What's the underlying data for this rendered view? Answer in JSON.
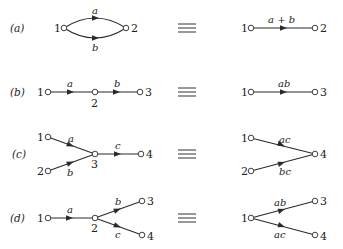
{
  "diagram": {
    "equiv_symbol": "≡",
    "rows": [
      {
        "id": "a",
        "label": "(a)",
        "left": {
          "nodes": [
            {
              "id": "1",
              "label": "1"
            },
            {
              "id": "2",
              "label": "2"
            }
          ],
          "edges": [
            {
              "from": "1",
              "to": "2",
              "label": "a",
              "shape": "upper-arc"
            },
            {
              "from": "1",
              "to": "2",
              "label": "b",
              "shape": "lower-arc"
            }
          ]
        },
        "right": {
          "nodes": [
            {
              "id": "1",
              "label": "1"
            },
            {
              "id": "2",
              "label": "2"
            }
          ],
          "edges": [
            {
              "from": "1",
              "to": "2",
              "label": "a + b"
            }
          ]
        }
      },
      {
        "id": "b",
        "label": "(b)",
        "left": {
          "nodes": [
            {
              "id": "1",
              "label": "1"
            },
            {
              "id": "2",
              "label": "2"
            },
            {
              "id": "3",
              "label": "3"
            }
          ],
          "edges": [
            {
              "from": "1",
              "to": "2",
              "label": "a"
            },
            {
              "from": "2",
              "to": "3",
              "label": "b"
            }
          ]
        },
        "right": {
          "nodes": [
            {
              "id": "1",
              "label": "1"
            },
            {
              "id": "3",
              "label": "3"
            }
          ],
          "edges": [
            {
              "from": "1",
              "to": "3",
              "label": "ab"
            }
          ]
        }
      },
      {
        "id": "c",
        "label": "(c)",
        "left": {
          "nodes": [
            {
              "id": "1",
              "label": "1"
            },
            {
              "id": "2",
              "label": "2"
            },
            {
              "id": "3",
              "label": "3"
            },
            {
              "id": "4",
              "label": "4"
            }
          ],
          "edges": [
            {
              "from": "1",
              "to": "3",
              "label": "a"
            },
            {
              "from": "2",
              "to": "3",
              "label": "b"
            },
            {
              "from": "3",
              "to": "4",
              "label": "c"
            }
          ]
        },
        "right": {
          "nodes": [
            {
              "id": "1",
              "label": "1"
            },
            {
              "id": "2",
              "label": "2"
            },
            {
              "id": "4",
              "label": "4"
            }
          ],
          "edges": [
            {
              "from": "1",
              "to": "4",
              "label": "ac"
            },
            {
              "from": "2",
              "to": "4",
              "label": "bc"
            }
          ]
        }
      },
      {
        "id": "d",
        "label": "(d)",
        "left": {
          "nodes": [
            {
              "id": "1",
              "label": "1"
            },
            {
              "id": "2",
              "label": "2"
            },
            {
              "id": "3",
              "label": "3"
            },
            {
              "id": "4",
              "label": "4"
            }
          ],
          "edges": [
            {
              "from": "1",
              "to": "2",
              "label": "a"
            },
            {
              "from": "2",
              "to": "3",
              "label": "b"
            },
            {
              "from": "2",
              "to": "4",
              "label": "c"
            }
          ]
        },
        "right": {
          "nodes": [
            {
              "id": "1",
              "label": "1"
            },
            {
              "id": "3",
              "label": "3"
            },
            {
              "id": "4",
              "label": "4"
            }
          ],
          "edges": [
            {
              "from": "1",
              "to": "3",
              "label": "ab"
            },
            {
              "from": "1",
              "to": "4",
              "label": "ac"
            }
          ]
        }
      }
    ]
  }
}
